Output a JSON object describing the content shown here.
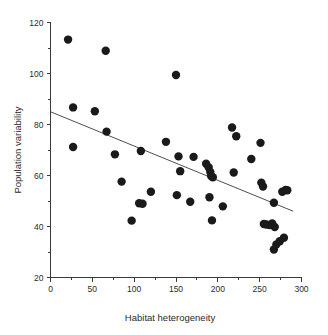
{
  "chart_data": {
    "type": "scatter",
    "title": "",
    "xlabel": "Habitat heterogeneity",
    "ylabel": "Population variability",
    "xlim": [
      0,
      300
    ],
    "ylim": [
      20,
      120
    ],
    "grid": false,
    "legend": "none",
    "x_ticks_major": [
      0,
      50,
      100,
      150,
      200,
      250,
      300
    ],
    "x_ticks_minor": [
      25,
      75,
      125,
      175,
      225,
      275
    ],
    "y_ticks_major": [
      20,
      40,
      60,
      80,
      100,
      120
    ],
    "y_ticks_minor": [
      30,
      50,
      70,
      90,
      110
    ],
    "x_tick_labels": [
      "0",
      "50",
      "100",
      "150",
      "200",
      "250",
      "300"
    ],
    "y_tick_labels": [
      "20",
      "40",
      "60",
      "80",
      "100",
      "120"
    ],
    "marker": "filled-circle",
    "marker_color": "#1a1a1a",
    "marker_size": 4.2,
    "points": [
      {
        "x": 21,
        "y": 113.3
      },
      {
        "x": 27,
        "y": 86.7
      },
      {
        "x": 27,
        "y": 71.2
      },
      {
        "x": 53,
        "y": 85.2
      },
      {
        "x": 66,
        "y": 108.9
      },
      {
        "x": 67,
        "y": 77.2
      },
      {
        "x": 77,
        "y": 68.3
      },
      {
        "x": 85,
        "y": 57.6
      },
      {
        "x": 97,
        "y": 42.3
      },
      {
        "x": 106,
        "y": 49.1
      },
      {
        "x": 108,
        "y": 69.6
      },
      {
        "x": 110,
        "y": 48.9
      },
      {
        "x": 120,
        "y": 53.6
      },
      {
        "x": 138,
        "y": 73.2
      },
      {
        "x": 150,
        "y": 99.4
      },
      {
        "x": 151,
        "y": 52.3
      },
      {
        "x": 153,
        "y": 67.5
      },
      {
        "x": 155,
        "y": 61.7
      },
      {
        "x": 167,
        "y": 49.7
      },
      {
        "x": 171,
        "y": 67.3
      },
      {
        "x": 186,
        "y": 64.6
      },
      {
        "x": 189,
        "y": 63.2
      },
      {
        "x": 190,
        "y": 51.5
      },
      {
        "x": 191,
        "y": 61.4
      },
      {
        "x": 192,
        "y": 59.8
      },
      {
        "x": 193,
        "y": 42.4
      },
      {
        "x": 194,
        "y": 59.3
      },
      {
        "x": 206,
        "y": 47.9
      },
      {
        "x": 217,
        "y": 78.8
      },
      {
        "x": 219,
        "y": 61.2
      },
      {
        "x": 222,
        "y": 75.4
      },
      {
        "x": 240,
        "y": 66.5
      },
      {
        "x": 251,
        "y": 72.8
      },
      {
        "x": 252,
        "y": 57.2
      },
      {
        "x": 254,
        "y": 55.7
      },
      {
        "x": 255,
        "y": 41.0
      },
      {
        "x": 258,
        "y": 40.8
      },
      {
        "x": 262,
        "y": 40.6
      },
      {
        "x": 265,
        "y": 41.2
      },
      {
        "x": 267,
        "y": 31.0
      },
      {
        "x": 267,
        "y": 49.3
      },
      {
        "x": 268,
        "y": 39.8
      },
      {
        "x": 270,
        "y": 33.0
      },
      {
        "x": 274,
        "y": 34.2
      },
      {
        "x": 277,
        "y": 53.6
      },
      {
        "x": 279,
        "y": 35.6
      },
      {
        "x": 281,
        "y": 54.3
      },
      {
        "x": 283,
        "y": 54.2
      }
    ],
    "fit_line": {
      "name": "regression-line",
      "x_start": 0,
      "y_start": 85.0,
      "x_end": 290,
      "y_end": 46.0,
      "color": "#3a3a3a"
    }
  }
}
